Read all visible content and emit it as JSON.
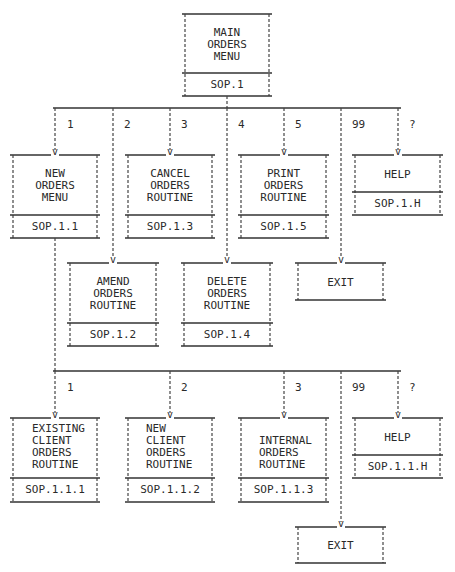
{
  "diagram": {
    "type": "menu-hierarchy",
    "root": {
      "id": "main",
      "title": "MAIN\nORDERS\nMENU",
      "code": "SOP.1"
    },
    "level1": {
      "options": [
        {
          "key": "1",
          "target": "new_orders_menu"
        },
        {
          "key": "2",
          "target": "amend"
        },
        {
          "key": "3",
          "target": "cancel"
        },
        {
          "key": "4",
          "target": "delete"
        },
        {
          "key": "5",
          "target": "print"
        },
        {
          "key": "99",
          "target": "exit1"
        },
        {
          "key": "?",
          "target": "help1"
        }
      ],
      "nodes": {
        "new_orders_menu": {
          "title": "NEW\nORDERS\nMENU",
          "code": "SOP.1.1"
        },
        "cancel": {
          "title": "CANCEL\nORDERS\nROUTINE",
          "code": "SOP.1.3"
        },
        "print": {
          "title": "PRINT\nORDERS\nROUTINE",
          "code": "SOP.1.5"
        },
        "help1": {
          "title": "HELP",
          "code": "SOP.1.H"
        },
        "amend": {
          "title": "AMEND\nORDERS\nROUTINE",
          "code": "SOP.1.2"
        },
        "delete": {
          "title": "DELETE\nORDERS\nROUTINE",
          "code": "SOP.1.4"
        },
        "exit1": {
          "title": "EXIT"
        }
      }
    },
    "level2": {
      "parent": "new_orders_menu",
      "options": [
        {
          "key": "1",
          "target": "existing"
        },
        {
          "key": "2",
          "target": "newclient"
        },
        {
          "key": "3",
          "target": "internal"
        },
        {
          "key": "99",
          "target": "exit2"
        },
        {
          "key": "?",
          "target": "help2"
        }
      ],
      "nodes": {
        "existing": {
          "title": "EXISTING\nCLIENT\nORDERS\nROUTINE",
          "code": "SOP.1.1.1"
        },
        "newclient": {
          "title": "NEW\nCLIENT\nORDERS\nROUTINE",
          "code": "SOP.1.1.2"
        },
        "internal": {
          "title": "INTERNAL\nORDERS\nROUTINE",
          "code": "SOP.1.1.3"
        },
        "help2": {
          "title": "HELP",
          "code": "SOP.1.1.H"
        },
        "exit2": {
          "title": "EXIT"
        }
      }
    },
    "arrow_glyph": "v"
  }
}
